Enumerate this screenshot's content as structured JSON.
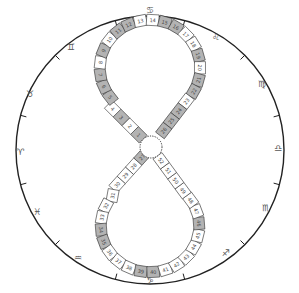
{
  "diagram": {
    "title": "",
    "outer_circle": {
      "cx": 150,
      "cy": 150,
      "r": 134,
      "stroke": "#222222"
    },
    "center_marker": {
      "cx": 151,
      "cy": 147,
      "r": 11,
      "style": "dotted"
    },
    "colors": {
      "shaded": "#b3b3b3",
      "plain": "#ffffff",
      "border": "#333333"
    },
    "zodiac": [
      {
        "name": "cancer",
        "glyph": "♋",
        "x": 150,
        "y": 10
      },
      {
        "name": "leo",
        "glyph": "♌",
        "x": 216,
        "y": 37
      },
      {
        "name": "virgo",
        "glyph": "♍",
        "x": 262,
        "y": 84
      },
      {
        "name": "libra",
        "glyph": "♎",
        "x": 278,
        "y": 148
      },
      {
        "name": "scorpio",
        "glyph": "♏",
        "x": 266,
        "y": 208
      },
      {
        "name": "sagittarius",
        "glyph": "♐",
        "x": 226,
        "y": 253
      },
      {
        "name": "capricorn",
        "glyph": "♑",
        "x": 150,
        "y": 280
      },
      {
        "name": "aquarius",
        "glyph": "♒",
        "x": 78,
        "y": 258
      },
      {
        "name": "pisces",
        "glyph": "♓",
        "x": 37,
        "y": 212
      },
      {
        "name": "aries",
        "glyph": "♈",
        "x": 20,
        "y": 152
      },
      {
        "name": "taurus",
        "glyph": "♉",
        "x": 30,
        "y": 94
      },
      {
        "name": "gemini",
        "glyph": "♊",
        "x": 71,
        "y": 47
      }
    ],
    "tick_angles_deg": [
      -75,
      -45,
      -15,
      15,
      45,
      75,
      105,
      135,
      165,
      195,
      225,
      255
    ],
    "cells": [
      {
        "n": "1",
        "shaded": true
      },
      {
        "n": "2",
        "shaded": false
      },
      {
        "n": "3",
        "shaded": true
      },
      {
        "n": "4",
        "shaded": false
      },
      {
        "n": "5",
        "shaded": true
      },
      {
        "n": "6",
        "shaded": true
      },
      {
        "n": "7",
        "shaded": true
      },
      {
        "n": "8",
        "shaded": false
      },
      {
        "n": "9",
        "shaded": true
      },
      {
        "n": "10",
        "shaded": false
      },
      {
        "n": "11",
        "shaded": true
      },
      {
        "n": "12",
        "shaded": true
      },
      {
        "n": "13",
        "shaded": false
      },
      {
        "n": "14",
        "shaded": false
      },
      {
        "n": "15",
        "shaded": true
      },
      {
        "n": "16",
        "shaded": true
      },
      {
        "n": "17",
        "shaded": false
      },
      {
        "n": "18",
        "shaded": false
      },
      {
        "n": "19",
        "shaded": true
      },
      {
        "n": "20",
        "shaded": false
      },
      {
        "n": "21",
        "shaded": true
      },
      {
        "n": "22",
        "shaded": true
      },
      {
        "n": "23",
        "shaded": false
      },
      {
        "n": "24",
        "shaded": true
      },
      {
        "n": "25",
        "shaded": true
      },
      {
        "n": "26",
        "shaded": true
      },
      {
        "n": "27",
        "shaded": true
      },
      {
        "n": "28",
        "shaded": false
      },
      {
        "n": "29",
        "shaded": false
      },
      {
        "n": "30",
        "shaded": false
      },
      {
        "n": "31",
        "shaded": false
      },
      {
        "n": "32",
        "shaded": false
      },
      {
        "n": "33",
        "shaded": false
      },
      {
        "n": "34",
        "shaded": true
      },
      {
        "n": "35",
        "shaded": true
      },
      {
        "n": "36",
        "shaded": false
      },
      {
        "n": "37",
        "shaded": false
      },
      {
        "n": "38",
        "shaded": false
      },
      {
        "n": "39",
        "shaded": true
      },
      {
        "n": "40",
        "shaded": true
      },
      {
        "n": "41",
        "shaded": false
      },
      {
        "n": "42",
        "shaded": false
      },
      {
        "n": "43",
        "shaded": false
      },
      {
        "n": "44",
        "shaded": false
      },
      {
        "n": "45",
        "shaded": false
      },
      {
        "n": "46",
        "shaded": true
      },
      {
        "n": "47",
        "shaded": false
      },
      {
        "n": "48",
        "shaded": false
      },
      {
        "n": "49",
        "shaded": false
      },
      {
        "n": "50",
        "shaded": false
      },
      {
        "n": "51",
        "shaded": false
      },
      {
        "n": "52",
        "shaded": false
      }
    ]
  }
}
